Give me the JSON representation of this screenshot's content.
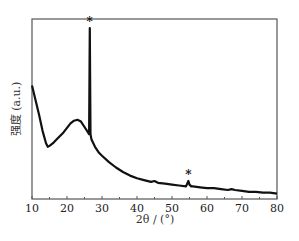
{
  "chart_data": {
    "type": "line",
    "title": "",
    "xlabel": "2θ / (°)",
    "ylabel": "强度 (a.u.)",
    "xlim": [
      10,
      80
    ],
    "ylim": [
      0,
      100
    ],
    "grid": false,
    "legend": null,
    "x_ticks": [
      10,
      20,
      30,
      40,
      50,
      60,
      70,
      80
    ],
    "x_tick_labels": [
      "10",
      "20",
      "30",
      "40",
      "50",
      "60",
      "70",
      "80"
    ],
    "y_ticks": [],
    "series": [
      {
        "name": "XRD pattern",
        "color": "#111111",
        "x": [
          10,
          11,
          12,
          13,
          14,
          14.5,
          15,
          16,
          17,
          18,
          19,
          20,
          21,
          22,
          23,
          24,
          25,
          26,
          26.3,
          26.5,
          26.7,
          27,
          28,
          29,
          30,
          32,
          34,
          36,
          38,
          40,
          42,
          44,
          45,
          46,
          48,
          50,
          52,
          54,
          54.7,
          55,
          55.5,
          56,
          58,
          60,
          62,
          64,
          66,
          67,
          68,
          70,
          72,
          74,
          76,
          78,
          80
        ],
        "y": [
          63,
          55,
          47,
          38,
          31,
          29,
          29.5,
          31,
          33,
          35,
          37,
          39.5,
          42,
          43.5,
          44,
          43,
          40,
          37,
          36,
          95,
          36,
          33,
          29,
          26,
          24,
          20.5,
          17.5,
          15,
          13,
          11.5,
          10.5,
          9.5,
          10,
          9,
          8.5,
          8,
          7.5,
          7,
          10,
          8,
          7,
          7,
          6.5,
          6,
          6,
          5.5,
          5,
          5.5,
          5,
          4.5,
          4,
          4,
          3.5,
          3.5,
          3
        ]
      }
    ],
    "annotations": [
      {
        "text": "*",
        "x": 26.5,
        "note": "sharp diffraction peak"
      },
      {
        "text": "*",
        "x": 54.7,
        "note": "small diffraction peak"
      }
    ]
  }
}
